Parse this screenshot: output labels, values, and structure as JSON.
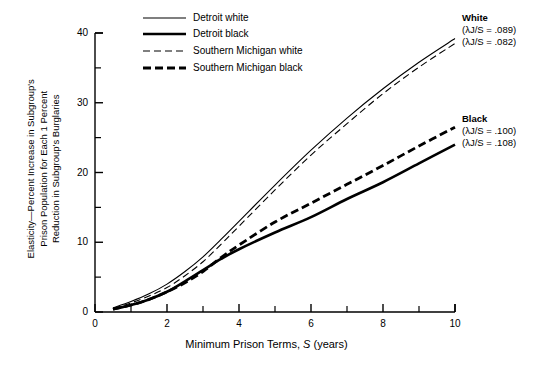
{
  "chart_data": {
    "type": "line",
    "title": "",
    "xlabel": "Minimum Prison Terms, S (years)",
    "ylabel": "Elasticity—Percent Increase in Subgroup's Prison Population for Each 1 Percent Reduction in Subgroup's Burglaries",
    "xlim": [
      0,
      10
    ],
    "ylim": [
      0,
      40
    ],
    "xticks": [
      0,
      1,
      2,
      3,
      4,
      5,
      6,
      7,
      8,
      9,
      10
    ],
    "xtick_labels": [
      "0",
      "",
      "2",
      "",
      "4",
      "",
      "6",
      "",
      "8",
      "",
      "10"
    ],
    "yticks": [
      0,
      5,
      10,
      15,
      20,
      25,
      30,
      35,
      40
    ],
    "ytick_labels": [
      "0",
      "",
      "10",
      "",
      "20",
      "",
      "30",
      "",
      "40"
    ],
    "grid": false,
    "legend_position": "top-center",
    "x": [
      0.5,
      1,
      1.5,
      2,
      2.5,
      3,
      3.5,
      4,
      5,
      6,
      7,
      8,
      9,
      10
    ],
    "series": [
      {
        "name": "Detroit white",
        "style": "solid-thin",
        "values": [
          0.6,
          1.5,
          2.6,
          4.0,
          5.8,
          7.9,
          10.4,
          13.0,
          18.2,
          23.2,
          27.8,
          32.0,
          35.8,
          39.2
        ]
      },
      {
        "name": "Detroit black",
        "style": "solid-thick",
        "values": [
          0.4,
          1.0,
          1.8,
          2.9,
          4.4,
          6.0,
          7.6,
          9.0,
          11.4,
          13.6,
          16.2,
          18.6,
          21.3,
          24.0
        ]
      },
      {
        "name": "Southern Michigan white",
        "style": "dashed-thin",
        "values": [
          0.5,
          1.3,
          2.3,
          3.5,
          5.2,
          7.2,
          9.7,
          12.3,
          17.5,
          22.5,
          27.0,
          31.3,
          35.1,
          38.5
        ]
      },
      {
        "name": "Southern Michigan black",
        "style": "dashed-thick",
        "values": [
          0.4,
          1.0,
          1.8,
          2.9,
          4.2,
          5.8,
          7.8,
          9.6,
          12.9,
          15.6,
          18.3,
          21.0,
          23.8,
          26.5
        ]
      }
    ],
    "legend": [
      {
        "label": "Detroit white",
        "style": "solid-thin"
      },
      {
        "label": "Detroit black",
        "style": "solid-thick"
      },
      {
        "label": "Southern Michigan white",
        "style": "dashed-thin"
      },
      {
        "label": "Southern Michigan black",
        "style": "dashed-thick"
      }
    ],
    "annotations": [
      {
        "title": "White",
        "line1": "(λJ/S = .089)",
        "line2": "(λJ/S = .082)"
      },
      {
        "title": "Black",
        "line1": "(λJ/S = .100)",
        "line2": "(λJ/S = .108)"
      }
    ]
  },
  "ylabel_lines": [
    "Elasticity—Percent Increase in Subgroup's",
    "Prison Population for Each 1 Percent",
    "Reduction in Subgroup's Burglaries"
  ],
  "xlabel_parts": {
    "pre": "Minimum Prison Terms, ",
    "sym": "S",
    "post": " (years)"
  }
}
